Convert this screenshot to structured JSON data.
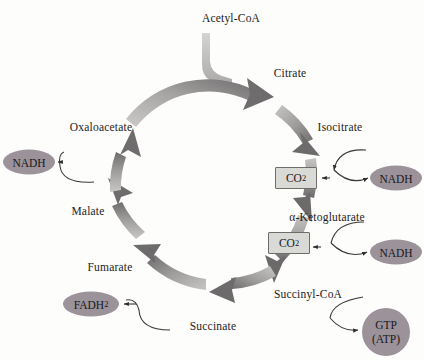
{
  "figure": {
    "name": "citric-acid-cycle",
    "background_color": "#fdfdfc"
  },
  "colors": {
    "ring_light": "#c8c6c4",
    "ring_mid": "#9a9896",
    "ring_dark": "#6e6c6d",
    "node_fill": "#9b929a",
    "box_fill": "#d9d9d6",
    "box_border": "#6e6d6b",
    "text": "#1c1b1a",
    "connector": "#3a3a3a"
  },
  "input": {
    "label": "Acetyl-CoA"
  },
  "cycle_intermediates": [
    {
      "id": "citrate",
      "label": "Citrate",
      "x": 290,
      "y": 74
    },
    {
      "id": "isocitrate",
      "label": "Isocitrate",
      "x": 340,
      "y": 128
    },
    {
      "id": "alpha-ketoglutarate",
      "label": "α-Ketoglutarate",
      "x": 327,
      "y": 218
    },
    {
      "id": "succinyl-coa",
      "label": "Succinyl-CoA",
      "x": 308,
      "y": 295
    },
    {
      "id": "succinate",
      "label": "Succinate",
      "x": 213,
      "y": 327
    },
    {
      "id": "fumarate",
      "label": "Fumarate",
      "x": 110,
      "y": 268
    },
    {
      "id": "malate",
      "label": "Malate",
      "x": 88,
      "y": 212
    },
    {
      "id": "oxaloacetate",
      "label": "Oxaloacetate",
      "x": 101,
      "y": 128
    }
  ],
  "products": [
    {
      "id": "nadh-isocitrate",
      "label": "NADH",
      "shape": "ellipse",
      "x": 396,
      "y": 178,
      "w": 52,
      "h": 25,
      "from": "isocitrate"
    },
    {
      "id": "nadh-alpha-ketoglutarate",
      "label": "NADH",
      "shape": "ellipse",
      "x": 396,
      "y": 252,
      "w": 52,
      "h": 25,
      "from": "alpha-ketoglutarate"
    },
    {
      "id": "gtp-atp",
      "label_line1": "GTP",
      "label_line2": "(ATP)",
      "shape": "circle",
      "x": 386,
      "y": 332,
      "w": 48,
      "h": 48,
      "from": "succinyl-coa"
    },
    {
      "id": "fadh2",
      "label": "FADH",
      "label_sub": "2",
      "shape": "ellipse",
      "x": 91,
      "y": 304,
      "w": 56,
      "h": 25,
      "from": "succinate"
    },
    {
      "id": "nadh-malate",
      "label": "NADH",
      "shape": "ellipse",
      "x": 29,
      "y": 162,
      "w": 52,
      "h": 25,
      "from": "malate"
    }
  ],
  "byproducts": [
    {
      "id": "co2-isocitrate",
      "label": "CO",
      "label_sub": "2",
      "shape": "box",
      "x": 296,
      "y": 178,
      "w": 40,
      "h": 20,
      "from": "isocitrate"
    },
    {
      "id": "co2-alpha-ketoglutarate",
      "label": "CO",
      "label_sub": "2",
      "shape": "box",
      "x": 289,
      "y": 243,
      "w": 40,
      "h": 20,
      "from": "alpha-ketoglutarate"
    }
  ],
  "geometry": {
    "center_x": 213,
    "center_y": 186,
    "radius": 104,
    "ring_width": 11,
    "segments": 8
  }
}
